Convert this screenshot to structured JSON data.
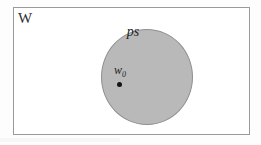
{
  "figure": {
    "type": "set-diagram",
    "universe": {
      "label": "W",
      "shape": "rectangle",
      "fill_color": "#ffffff",
      "border_color": "#9a9a9a"
    },
    "disk": {
      "label": "ps",
      "shape": "circle",
      "fill_color": "#b9b9b9",
      "border_color": "#8f8f8f"
    },
    "center": {
      "label_base": "w",
      "label_subscript": "0",
      "point_color": "#141414"
    }
  },
  "background": {
    "page_color": "#fdfdfd"
  }
}
